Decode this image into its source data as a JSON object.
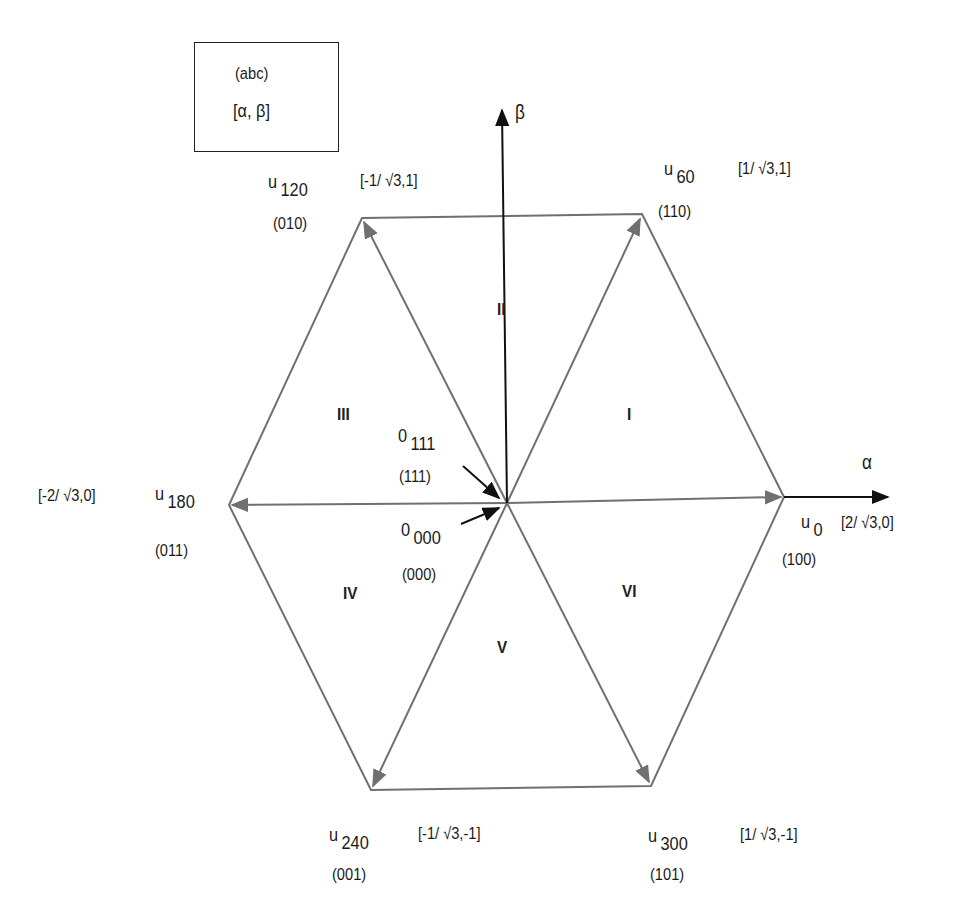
{
  "legend": {
    "line1": "(abc)",
    "line2": "[α, β]"
  },
  "axes": {
    "alpha_label": "α",
    "beta_label": "β"
  },
  "vectors": [
    {
      "id": "u0",
      "name": "u",
      "sub": "0",
      "state": "(100)",
      "coord": "[2/  √3,0]"
    },
    {
      "id": "u60",
      "name": "u",
      "sub": "60",
      "state": "(110)",
      "coord": "[1/  √3,1]"
    },
    {
      "id": "u120",
      "name": "u",
      "sub": "120",
      "state": "(010)",
      "coord": "[-1/  √3,1]"
    },
    {
      "id": "u180",
      "name": "u",
      "sub": "180",
      "state": "(011)",
      "coord": "[-2/  √3,0]"
    },
    {
      "id": "u240",
      "name": "u",
      "sub": "240",
      "state": "(001)",
      "coord": "[-1/  √3,-1]"
    },
    {
      "id": "u300",
      "name": "u",
      "sub": "300",
      "state": "(101)",
      "coord": "[1/  √3,-1]"
    }
  ],
  "zero_vectors": [
    {
      "id": "o111",
      "name": "0",
      "sub": "111",
      "state": "(111)"
    },
    {
      "id": "o000",
      "name": "0",
      "sub": "000",
      "state": "(000)"
    }
  ],
  "sectors": [
    "I",
    "II",
    "III",
    "IV",
    "V",
    "VI"
  ],
  "colors": {
    "line": "#707070",
    "axis": "#111111",
    "text": "#1a1a1a"
  }
}
